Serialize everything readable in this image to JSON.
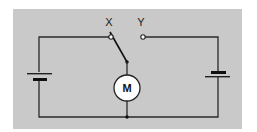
{
  "diagram": {
    "type": "circuit-schematic",
    "background_color": "#c9c9c9",
    "switch": {
      "contact_x_label": "X",
      "contact_y_label": "Y",
      "position": "X"
    },
    "motor": {
      "label": "M"
    },
    "batteries": [
      {
        "side": "left",
        "orientation": "long-plate-top"
      },
      {
        "side": "right",
        "orientation": "short-plate-top"
      }
    ]
  }
}
